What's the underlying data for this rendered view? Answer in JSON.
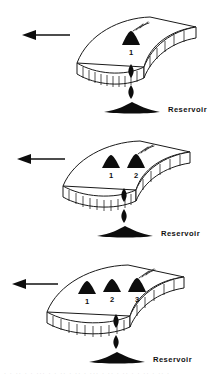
{
  "figure": {
    "background_color": "#ffffff",
    "ink_color": "#111111",
    "panel_count": 3
  },
  "labels": {
    "reservoir": "Reservoir",
    "volcano_1": "1",
    "volcano_2": "2",
    "volcano_3": "3"
  },
  "panels": [
    {
      "stage": 1,
      "reservoir_label": "Reservoir",
      "motion_arrow_direction": "left",
      "volcanoes": [
        {
          "number": "1",
          "active": true,
          "smoke": true
        }
      ],
      "magma_blobs": 2
    },
    {
      "stage": 2,
      "reservoir_label": "Reservoir",
      "motion_arrow_direction": "left",
      "volcanoes": [
        {
          "number": "1",
          "active": false,
          "smoke": false
        },
        {
          "number": "2",
          "active": true,
          "smoke": true
        }
      ],
      "magma_blobs": 2
    },
    {
      "stage": 3,
      "reservoir_label": "Reservoir",
      "motion_arrow_direction": "left",
      "volcanoes": [
        {
          "number": "1",
          "active": false,
          "smoke": false
        },
        {
          "number": "2",
          "active": false,
          "smoke": false
        },
        {
          "number": "3",
          "active": true,
          "smoke": true
        }
      ],
      "magma_blobs": 2
    }
  ],
  "caption": {
    "cut_off_line": "· · ·· · · ··· · · ·· ·  ·· · ··· · ·· · ··  · · ·· · ·· ·"
  }
}
